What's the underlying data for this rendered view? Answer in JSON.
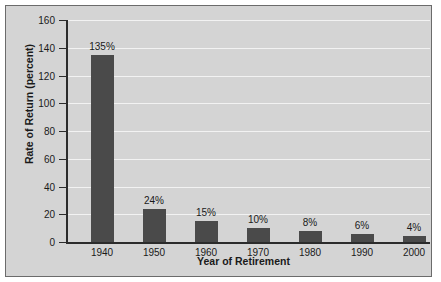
{
  "chart_data": {
    "type": "bar",
    "title": "",
    "xlabel": "Year of Retirement",
    "ylabel": "Rate of Return (percent)",
    "categories": [
      "1940",
      "1950",
      "1960",
      "1970",
      "1980",
      "1990",
      "2000"
    ],
    "values": [
      135,
      24,
      15,
      10,
      8,
      6,
      4
    ],
    "data_labels": [
      "135%",
      "24%",
      "15%",
      "10%",
      "8%",
      "6%",
      "4%"
    ],
    "ylim": [
      0,
      160
    ],
    "ytick_labels": [
      "160",
      "140",
      "120",
      "100",
      "80",
      "60",
      "40",
      "20",
      "0"
    ],
    "ytick_values": [
      160,
      140,
      120,
      100,
      80,
      60,
      40,
      20,
      0
    ],
    "grid": true,
    "legend": null,
    "colors": {
      "bar": "#4a4a4a",
      "plot_background": "#d4d4d4",
      "gridline": "#f2f2f2",
      "axis": "#2b2b2b",
      "border": "#6b6b6b",
      "text": "#1a1a1a"
    }
  }
}
